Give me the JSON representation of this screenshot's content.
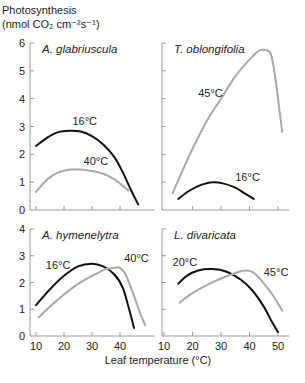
{
  "chart_data": {
    "type": "line",
    "ylabel_line1": "Photosynthesis",
    "ylabel_line2": "(nmol CO₂ cm⁻²s⁻¹)",
    "xlabel": "Leaf temperature (°C)",
    "colors": {
      "black": "#111111",
      "gray": "#a8a8a8"
    },
    "panels": [
      {
        "id": "top-left",
        "title": "A. glabriuscula",
        "ylim": [
          0,
          6
        ],
        "yticks": [
          0,
          1,
          2,
          3,
          4,
          5,
          6
        ],
        "show_ytick_labels": true,
        "xticks": [
          10,
          20,
          30,
          40
        ],
        "show_xtick_labels": false,
        "series": [
          {
            "name": "16°C",
            "color": "black",
            "label_pos": [
              23,
              3.05
            ],
            "points": [
              [
                10,
                2.3
              ],
              [
                14,
                2.6
              ],
              [
                18,
                2.8
              ],
              [
                22,
                2.85
              ],
              [
                26,
                2.82
              ],
              [
                30,
                2.65
              ],
              [
                34,
                2.35
              ],
              [
                38,
                1.9
              ],
              [
                41,
                1.35
              ],
              [
                44,
                0.7
              ],
              [
                46.5,
                0.2
              ]
            ]
          },
          {
            "name": "40°C",
            "color": "gray",
            "label_pos": [
              27,
              1.6
            ],
            "points": [
              [
                10,
                0.65
              ],
              [
                14,
                1.1
              ],
              [
                18,
                1.35
              ],
              [
                22,
                1.45
              ],
              [
                26,
                1.45
              ],
              [
                30,
                1.4
              ],
              [
                34,
                1.3
              ],
              [
                38,
                1.1
              ],
              [
                43,
                0.7
              ]
            ]
          }
        ]
      },
      {
        "id": "top-right",
        "title": "T. oblongifolia",
        "ylim": [
          0,
          6
        ],
        "yticks": [
          0,
          1,
          2,
          3,
          4,
          5,
          6
        ],
        "show_ytick_labels": false,
        "xticks": [
          20,
          30,
          40,
          50
        ],
        "show_xtick_labels": false,
        "series": [
          {
            "name": "45°C",
            "color": "gray",
            "label_pos": [
              22,
              4.05
            ],
            "points": [
              [
                13,
                0.6
              ],
              [
                16,
                1.3
              ],
              [
                20,
                2.2
              ],
              [
                25,
                3.2
              ],
              [
                30,
                4.0
              ],
              [
                35,
                4.8
              ],
              [
                40,
                5.4
              ],
              [
                43,
                5.7
              ],
              [
                45.5,
                5.75
              ],
              [
                47.5,
                5.6
              ],
              [
                49,
                4.8
              ],
              [
                50.5,
                3.6
              ],
              [
                51.5,
                2.8
              ]
            ]
          },
          {
            "name": "16°C",
            "color": "black",
            "label_pos": [
              35,
              1.05
            ],
            "points": [
              [
                15,
                0.4
              ],
              [
                19,
                0.7
              ],
              [
                23,
                0.9
              ],
              [
                27,
                1.0
              ],
              [
                31,
                0.95
              ],
              [
                35,
                0.8
              ],
              [
                39,
                0.55
              ],
              [
                41.5,
                0.4
              ]
            ]
          }
        ]
      },
      {
        "id": "bottom-left",
        "title": "A. hymenelytra",
        "ylim": [
          0,
          4
        ],
        "yticks": [
          0,
          1,
          2,
          3,
          4
        ],
        "show_ytick_labels": true,
        "xticks": [
          10,
          20,
          30,
          40
        ],
        "show_xtick_labels": true,
        "series": [
          {
            "name": "16°C",
            "color": "black",
            "label_pos": [
              13.5,
              2.5
            ],
            "points": [
              [
                10,
                1.15
              ],
              [
                15,
                1.75
              ],
              [
                20,
                2.25
              ],
              [
                25,
                2.6
              ],
              [
                30,
                2.7
              ],
              [
                34,
                2.6
              ],
              [
                38,
                2.3
              ],
              [
                41,
                1.8
              ],
              [
                43,
                1.1
              ],
              [
                45,
                0.3
              ]
            ]
          },
          {
            "name": "40°C",
            "color": "gray",
            "label_pos": [
              41.5,
              2.75
            ],
            "points": [
              [
                11,
                0.7
              ],
              [
                15,
                1.1
              ],
              [
                20,
                1.55
              ],
              [
                25,
                1.95
              ],
              [
                30,
                2.25
              ],
              [
                35,
                2.5
              ],
              [
                38,
                2.55
              ],
              [
                40,
                2.55
              ],
              [
                42,
                2.3
              ],
              [
                45,
                1.5
              ],
              [
                47,
                0.9
              ],
              [
                49,
                0.4
              ]
            ]
          }
        ]
      },
      {
        "id": "bottom-right",
        "title": "L. divaricata",
        "ylim": [
          0,
          4
        ],
        "yticks": [
          0,
          1,
          2,
          3,
          4
        ],
        "show_ytick_labels": false,
        "xticks": [
          10,
          20,
          30,
          40,
          50
        ],
        "show_xtick_labels": true,
        "series": [
          {
            "name": "20°C",
            "color": "black",
            "label_pos": [
              13,
              2.6
            ],
            "points": [
              [
                15,
                1.95
              ],
              [
                18,
                2.25
              ],
              [
                22,
                2.45
              ],
              [
                27,
                2.5
              ],
              [
                32,
                2.4
              ],
              [
                37,
                2.1
              ],
              [
                41,
                1.7
              ],
              [
                45,
                1.1
              ],
              [
                48,
                0.5
              ],
              [
                50,
                0.15
              ]
            ]
          },
          {
            "name": "45°C",
            "color": "gray",
            "label_pos": [
              45,
              2.25
            ],
            "points": [
              [
                15.5,
                1.25
              ],
              [
                20,
                1.6
              ],
              [
                25,
                1.9
              ],
              [
                30,
                2.15
              ],
              [
                35,
                2.35
              ],
              [
                38,
                2.45
              ],
              [
                41,
                2.4
              ],
              [
                44,
                2.1
              ],
              [
                48,
                1.55
              ],
              [
                51.5,
                0.95
              ]
            ]
          }
        ]
      }
    ]
  }
}
